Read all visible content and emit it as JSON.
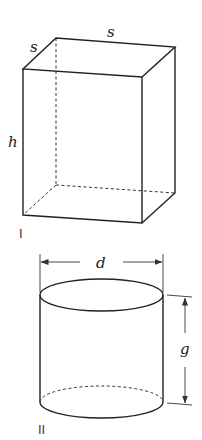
{
  "figures": [
    {
      "id": "I",
      "shape": "rectangular-box",
      "numeral": "I",
      "labels": {
        "top_width": "s",
        "top_depth": "s",
        "height": "h"
      }
    },
    {
      "id": "II",
      "shape": "cylinder",
      "numeral": "II",
      "labels": {
        "diameter": "d",
        "height": "g"
      }
    }
  ],
  "colors": {
    "line": "#222222",
    "background": "#ffffff"
  }
}
